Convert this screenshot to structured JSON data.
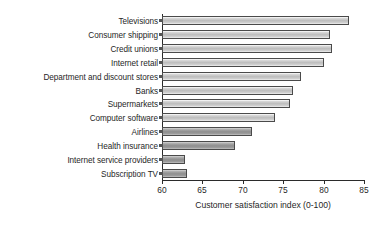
{
  "chart_data": {
    "type": "bar",
    "orientation": "horizontal",
    "title": "",
    "xlabel": "Customer satisfaction index (0-100)",
    "ylabel": "",
    "xlim": [
      60,
      85
    ],
    "xticks": [
      60,
      65,
      70,
      75,
      80,
      85
    ],
    "grid": false,
    "legend": null,
    "categories": [
      "Televisions",
      "Consumer shipping",
      "Credit unions",
      "Internet retail",
      "Department and discount stores",
      "Banks",
      "Supermarkets",
      "Computer software",
      "Airlines",
      "Health insurance",
      "Internet service providers",
      "Subscription TV"
    ],
    "values": [
      83.1,
      80.8,
      81.0,
      80.0,
      77.2,
      76.2,
      75.8,
      74.0,
      71.1,
      69.0,
      62.9,
      63.1
    ],
    "bar_shades": [
      "light",
      "light",
      "light",
      "light",
      "light",
      "light",
      "light",
      "light",
      "dark",
      "dark",
      "dark",
      "dark"
    ]
  },
  "style": {
    "bar_light_fill": "#bdbdbd",
    "bar_dark_fill": "#8e8e8e",
    "bar_border": "#4a4a4a",
    "axis_color": "#2b2b2b",
    "text_color": "#1f1f1f",
    "background": "#ffffff"
  }
}
